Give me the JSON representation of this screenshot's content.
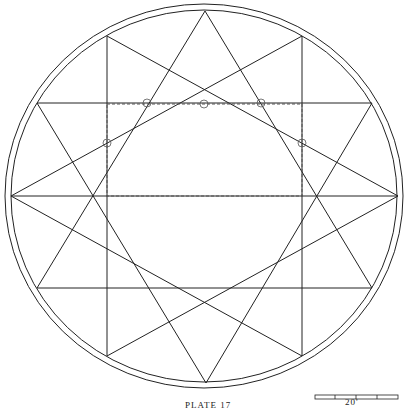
{
  "caption": "PLATE 17",
  "scale_bar": {
    "label": "20'",
    "divisions": 4
  },
  "figure": {
    "type": "twelve-point star within double circle",
    "dashed_rectangle": true,
    "marker_circles": 5
  }
}
